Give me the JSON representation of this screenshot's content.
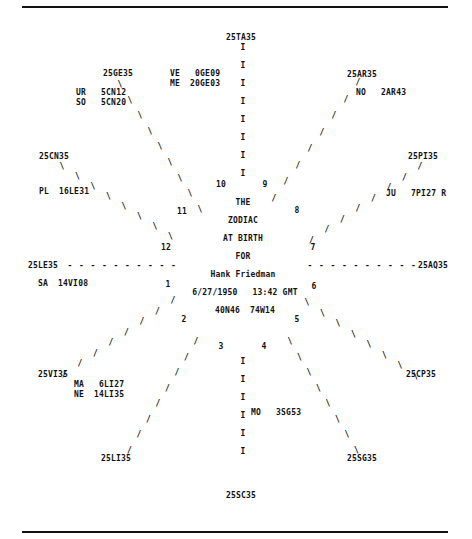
{
  "chart": {
    "title_lines": [
      "THE",
      "ZODIAC",
      "AT BIRTH",
      "FOR"
    ],
    "name": "Hank Friedman",
    "date_time": "6/27/1950   13:42 GMT",
    "coordinates": "40N46  74W14"
  },
  "cusps": {
    "top": "25TA35",
    "top_right": "25AR35",
    "right_upper": "25PI35",
    "right": "25AQ35",
    "right_lower": "25CP35",
    "bottom_right": "25SG35",
    "bottom": "25SC35",
    "bottom_left": "25LI35",
    "left_lower": "25VI35",
    "left": "25LE35",
    "left_upper": "25CN35",
    "top_left": "25GE35"
  },
  "houses": [
    "1",
    "2",
    "3",
    "4",
    "5",
    "6",
    "7",
    "8",
    "9",
    "10",
    "11",
    "12"
  ],
  "planets": {
    "venus": "VE   0GE09",
    "mercury": "ME  20GE03",
    "uranus": "UR   5CN12",
    "sun": "SO   5CN20",
    "node": "NO   2AR43",
    "pluto": "PL  16LE31",
    "jupiter": "JU   7PI27 R",
    "saturn": "SA  14VI08",
    "mars": "MA   6LI27",
    "neptune": "NE  14LI35",
    "moon": "MO   3SG53"
  },
  "glyphs": {
    "vertical": "I",
    "slash": "/",
    "backslash": "\\",
    "dash": "-"
  }
}
